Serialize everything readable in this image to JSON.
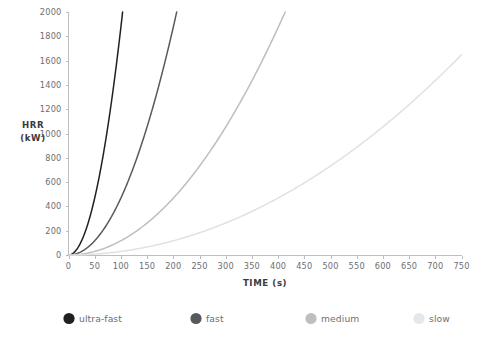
{
  "chart_data": {
    "type": "line",
    "title": "",
    "xlabel": "TIME (s)",
    "ylabel": "HRR\n(kW)",
    "ylabel_line1": "HRR",
    "ylabel_line2": "(kW)",
    "xlim": [
      0,
      750
    ],
    "ylim": [
      0,
      2000
    ],
    "xticks": [
      0,
      50,
      100,
      150,
      200,
      250,
      300,
      350,
      400,
      450,
      500,
      550,
      600,
      650,
      700,
      750
    ],
    "yticks": [
      0,
      200,
      400,
      600,
      800,
      1000,
      1200,
      1400,
      1600,
      1800,
      2000
    ],
    "grid": false,
    "legend_position": "bottom",
    "equation": "HRR = alpha * t^2",
    "series": [
      {
        "name": "ultra-fast",
        "color": "#231f20",
        "alpha": 0.1876,
        "x": [
          0,
          10,
          20,
          30,
          40,
          50,
          60,
          70,
          80,
          90,
          100,
          103.3
        ],
        "values": [
          0,
          19,
          75,
          169,
          300,
          469,
          675,
          919,
          1201,
          1519,
          1876,
          2002
        ]
      },
      {
        "name": "fast",
        "color": "#58595b",
        "alpha": 0.0469,
        "x": [
          0,
          20,
          40,
          60,
          80,
          100,
          120,
          140,
          160,
          180,
          200,
          206.6
        ],
        "values": [
          0,
          19,
          75,
          169,
          300,
          469,
          675,
          919,
          1201,
          1520,
          1876,
          2002
        ]
      },
      {
        "name": "medium",
        "color": "#bcbec0",
        "alpha": 0.0117,
        "x": [
          0,
          40,
          80,
          120,
          160,
          200,
          240,
          280,
          320,
          360,
          400,
          413.5
        ],
        "values": [
          0,
          19,
          75,
          168,
          300,
          468,
          674,
          917,
          1198,
          1516,
          1872,
          2001
        ]
      },
      {
        "name": "slow",
        "color": "#e0e1e2",
        "alpha": 0.00293,
        "x": [
          0,
          75,
          150,
          225,
          300,
          375,
          450,
          525,
          600,
          675,
          750
        ],
        "values": [
          0,
          16,
          66,
          148,
          264,
          412,
          593,
          808,
          1055,
          1335,
          1648
        ]
      }
    ],
    "legend": [
      {
        "label": "ultra-fast",
        "color": "#231f20"
      },
      {
        "label": "fast",
        "color": "#58595b"
      },
      {
        "label": "medium",
        "color": "#bcbec0"
      },
      {
        "label": "slow",
        "color": "#e6e7e8"
      }
    ],
    "colors": {
      "axis": "#bcbdc0",
      "tick_text": "#6d6e71",
      "axis_title": "#3b3b3d",
      "background": "#ffffff"
    }
  }
}
